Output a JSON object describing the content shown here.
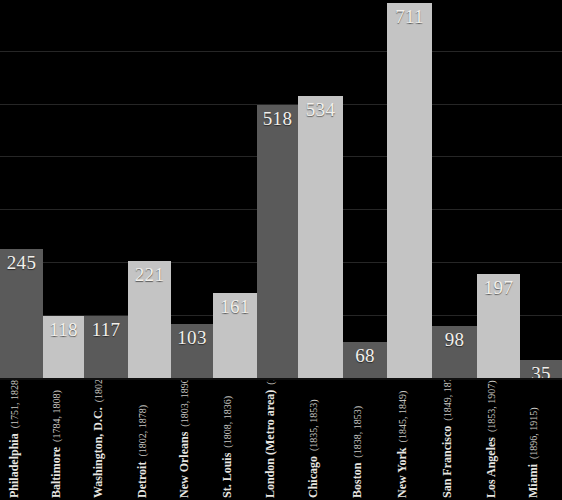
{
  "chart_data": {
    "type": "bar",
    "title": "",
    "subtitle": "",
    "xlabel": "",
    "ylabel": "",
    "ylim": [
      0,
      720
    ],
    "grid": true,
    "legend": "none",
    "orientation": "vertical",
    "bar_gap": 0,
    "categories": [
      "Philadelphia",
      "Baltimore",
      "Washington, D.C.",
      "Detroit",
      "New Orleans",
      "St. Louis",
      "London (Metro area)",
      "Chicago",
      "Boston",
      "New York",
      "San Francisco",
      "Los Angeles",
      "Miami"
    ],
    "category_sublabels": [
      "(1751, 1828)",
      "(1784, 1808)",
      "(1802, 1873)",
      "(1802, 1878)",
      "(1803, 1890)",
      "(1808, 1836)",
      "(1809, 1850)",
      "(1835, 1853)",
      "(1838, 1853)",
      "(1845, 1849)",
      "(1849, 1878)",
      "(1853, 1907)",
      "(1896, 1915)"
    ],
    "values": [
      245,
      118,
      117,
      221,
      103,
      161,
      518,
      534,
      68,
      711,
      98,
      197,
      35
    ],
    "value_labels": [
      "245",
      "118",
      "117",
      "221",
      "103",
      "161",
      "518",
      "534",
      "68",
      "711",
      "98",
      "197",
      "35"
    ],
    "bar_colors": [
      "#5a5a5a",
      "#c4c4c4",
      "#5a5a5a",
      "#c4c4c4",
      "#5a5a5a",
      "#c4c4c4",
      "#5a5a5a",
      "#c4c4c4",
      "#5a5a5a",
      "#c4c4c4",
      "#5a5a5a",
      "#c4c4c4",
      "#5a5a5a"
    ],
    "gridline_values": [
      720,
      620,
      520,
      420,
      320,
      220,
      120
    ],
    "background_color": "#000000",
    "gridline_color": "#262626",
    "label_text_color": "#f2f0ec"
  }
}
